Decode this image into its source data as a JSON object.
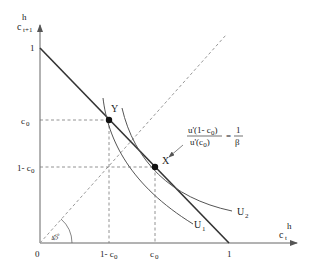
{
  "diagram": {
    "axes": {
      "y_label": "c",
      "y_label_sup": "h",
      "y_label_sub": "t+1",
      "x_label": "c",
      "x_label_sup": "h",
      "x_label_sub": "t",
      "origin": "0",
      "y_tick_one": "1",
      "x_tick_one": "1",
      "y_tick_c0": "c",
      "y_tick_c0_sub": "0",
      "y_tick_1mc0": "1- c",
      "y_tick_1mc0_sub": "0",
      "x_tick_1mc0": "1- c",
      "x_tick_1mc0_sub": "0",
      "x_tick_c0": "c",
      "x_tick_c0_sub": "0"
    },
    "angle_label": "45º",
    "points": {
      "y": "Y",
      "x": "X"
    },
    "curves": {
      "u1": "U",
      "u1_sub": "1",
      "u2": "U",
      "u2_sub": "2"
    },
    "equation": {
      "numerator": "u'(1- c",
      "numerator_sub": "0",
      "numerator_end": ")",
      "denominator": "u'(c",
      "denominator_sub": "0",
      "denominator_end": ")",
      "equals": "=",
      "rhs_num": "1",
      "rhs_den": "β"
    },
    "colors": {
      "line": "#333333",
      "dashed": "#666666",
      "curve": "#555555"
    }
  }
}
